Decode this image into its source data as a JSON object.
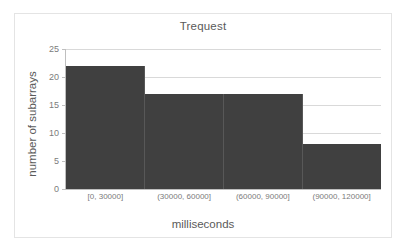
{
  "chart_data": {
    "type": "bar",
    "title": "Trequest",
    "xlabel": "milliseconds",
    "ylabel": "number of subarrays",
    "categories": [
      "[0, 30000]",
      "(30000, 60000]",
      "(60000, 90000]",
      "(90000, 120000]"
    ],
    "values": [
      22,
      17,
      17,
      8
    ],
    "ylim": [
      0,
      25
    ],
    "yticks": [
      0,
      5,
      10,
      15,
      20,
      25
    ],
    "ytick_labels": [
      "0",
      "5",
      "10",
      "15",
      "20",
      "25"
    ],
    "grid": true,
    "legend": false,
    "series_color": "#404040",
    "gridline_color": "#d9d9d9",
    "axis_color": "#bfbfbf",
    "text_color": "#5a5a5a",
    "tick_text_color": "#7b7b7b",
    "border_color": "#e4e4e4",
    "background": "#ffffff"
  }
}
